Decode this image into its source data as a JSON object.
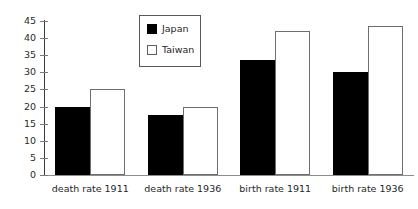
{
  "chart_data": {
    "type": "bar",
    "title": "",
    "xlabel": "",
    "ylabel": "",
    "ylim": [
      0,
      45
    ],
    "yticks": [
      0,
      5,
      10,
      15,
      20,
      25,
      30,
      35,
      40,
      45
    ],
    "ytick_labels": [
      "0",
      "5",
      "10",
      "15",
      "20",
      "25",
      "30",
      "35",
      "40",
      "45"
    ],
    "grid": false,
    "legend_position": "top-center",
    "categories": [
      "death rate 1911",
      "death rate 1936",
      "birth rate 1911",
      "birth rate 1936"
    ],
    "series": [
      {
        "name": "Japan",
        "color": "#000000",
        "values": [
          20,
          17.5,
          33.5,
          30
        ]
      },
      {
        "name": "Taiwan",
        "color": "#ffffff",
        "values": [
          25,
          20,
          42,
          43.5
        ]
      }
    ]
  },
  "legend": {
    "items": [
      {
        "label": "Japan",
        "swatch": "filled-black-square"
      },
      {
        "label": "Taiwan",
        "swatch": "open-white-square"
      }
    ]
  },
  "axis": {
    "y_axis_color": "#3a3a3a",
    "x_axis_color": "#8d8d8d",
    "tick_color": "#7a7a7a"
  }
}
